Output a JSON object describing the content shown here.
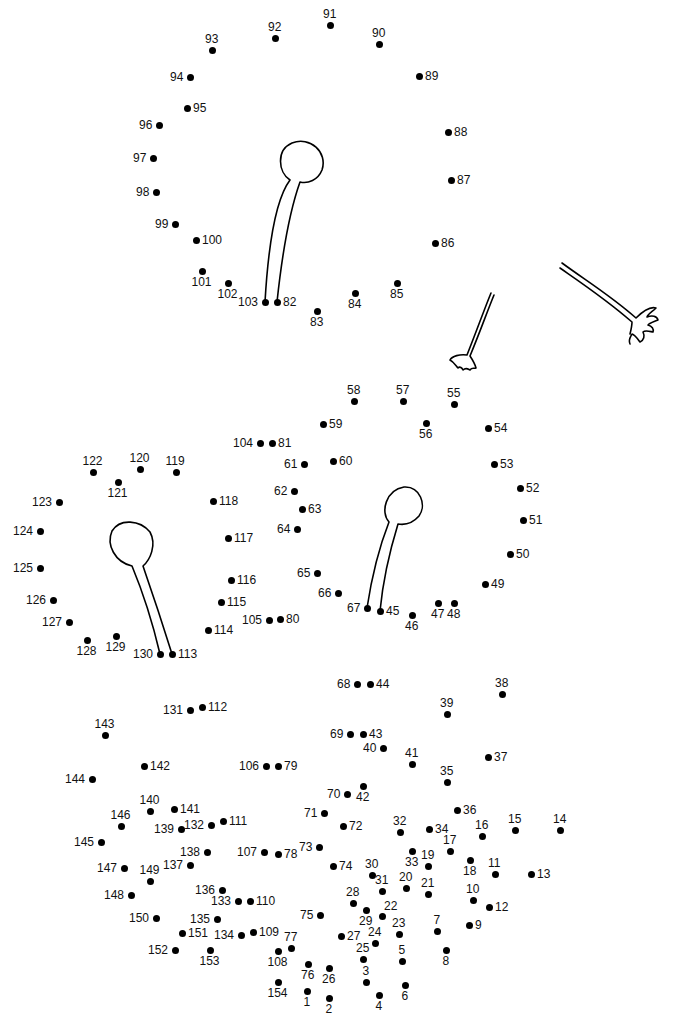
{
  "puzzle": {
    "title": "Connect the dots 1-154",
    "dot_color": "#000000",
    "line_color": "#000000",
    "dots": [
      {
        "n": 1,
        "x": 307,
        "y": 991,
        "lp": "b"
      },
      {
        "n": 2,
        "x": 329,
        "y": 998,
        "lp": "b"
      },
      {
        "n": 3,
        "x": 366,
        "y": 982,
        "lp": "t"
      },
      {
        "n": 4,
        "x": 379,
        "y": 995,
        "lp": "b"
      },
      {
        "n": 5,
        "x": 402,
        "y": 961,
        "lp": "t"
      },
      {
        "n": 6,
        "x": 405,
        "y": 985,
        "lp": "b"
      },
      {
        "n": 7,
        "x": 437,
        "y": 931,
        "lp": "t"
      },
      {
        "n": 8,
        "x": 446,
        "y": 950,
        "lp": "b"
      },
      {
        "n": 9,
        "x": 469,
        "y": 925,
        "lp": "r"
      },
      {
        "n": 10,
        "x": 473,
        "y": 900,
        "lp": "t"
      },
      {
        "n": 11,
        "x": 495,
        "y": 874,
        "lp": "t"
      },
      {
        "n": 12,
        "x": 489,
        "y": 907,
        "lp": "r"
      },
      {
        "n": 13,
        "x": 531,
        "y": 874,
        "lp": "r"
      },
      {
        "n": 14,
        "x": 560,
        "y": 830,
        "lp": "t"
      },
      {
        "n": 15,
        "x": 515,
        "y": 830,
        "lp": "t"
      },
      {
        "n": 16,
        "x": 482,
        "y": 836,
        "lp": "t"
      },
      {
        "n": 17,
        "x": 450,
        "y": 851,
        "lp": "t"
      },
      {
        "n": 18,
        "x": 470,
        "y": 860,
        "lp": "b"
      },
      {
        "n": 19,
        "x": 428,
        "y": 866,
        "lp": "t"
      },
      {
        "n": 20,
        "x": 406,
        "y": 888,
        "lp": "t"
      },
      {
        "n": 21,
        "x": 428,
        "y": 894,
        "lp": "t"
      },
      {
        "n": 22,
        "x": 382,
        "y": 916,
        "lp": "tr"
      },
      {
        "n": 23,
        "x": 399,
        "y": 934,
        "lp": "t"
      },
      {
        "n": 24,
        "x": 375,
        "y": 943,
        "lp": "t"
      },
      {
        "n": 25,
        "x": 363,
        "y": 959,
        "lp": "t"
      },
      {
        "n": 26,
        "x": 329,
        "y": 968,
        "lp": "b"
      },
      {
        "n": 27,
        "x": 341,
        "y": 936,
        "lp": "r"
      },
      {
        "n": 28,
        "x": 353,
        "y": 903,
        "lp": "t"
      },
      {
        "n": 29,
        "x": 366,
        "y": 910,
        "lp": "b"
      },
      {
        "n": 30,
        "x": 372,
        "y": 875,
        "lp": "t"
      },
      {
        "n": 31,
        "x": 382,
        "y": 891,
        "lp": "t"
      },
      {
        "n": 32,
        "x": 400,
        "y": 832,
        "lp": "t"
      },
      {
        "n": 33,
        "x": 412,
        "y": 851,
        "lp": "b"
      },
      {
        "n": 34,
        "x": 429,
        "y": 829,
        "lp": "r"
      },
      {
        "n": 35,
        "x": 447,
        "y": 782,
        "lp": "t"
      },
      {
        "n": 36,
        "x": 457,
        "y": 810,
        "lp": "r"
      },
      {
        "n": 37,
        "x": 488,
        "y": 757,
        "lp": "r"
      },
      {
        "n": 38,
        "x": 502,
        "y": 694,
        "lp": "t"
      },
      {
        "n": 39,
        "x": 447,
        "y": 714,
        "lp": "t"
      },
      {
        "n": 40,
        "x": 383,
        "y": 748,
        "lp": "l"
      },
      {
        "n": 41,
        "x": 412,
        "y": 764,
        "lp": "t"
      },
      {
        "n": 42,
        "x": 363,
        "y": 786,
        "lp": "b"
      },
      {
        "n": 43,
        "x": 363,
        "y": 734,
        "lp": "r"
      },
      {
        "n": 44,
        "x": 370,
        "y": 684,
        "lp": "r"
      },
      {
        "n": 45,
        "x": 380,
        "y": 611,
        "lp": "r"
      },
      {
        "n": 46,
        "x": 412,
        "y": 615,
        "lp": "b"
      },
      {
        "n": 47,
        "x": 438,
        "y": 603,
        "lp": "b"
      },
      {
        "n": 48,
        "x": 454,
        "y": 603,
        "lp": "b"
      },
      {
        "n": 49,
        "x": 485,
        "y": 584,
        "lp": "r"
      },
      {
        "n": 50,
        "x": 510,
        "y": 554,
        "lp": "r"
      },
      {
        "n": 51,
        "x": 523,
        "y": 520,
        "lp": "r"
      },
      {
        "n": 52,
        "x": 520,
        "y": 488,
        "lp": "r"
      },
      {
        "n": 53,
        "x": 494,
        "y": 464,
        "lp": "r"
      },
      {
        "n": 54,
        "x": 488,
        "y": 428,
        "lp": "r"
      },
      {
        "n": 55,
        "x": 454,
        "y": 404,
        "lp": "t"
      },
      {
        "n": 56,
        "x": 426,
        "y": 423,
        "lp": "b"
      },
      {
        "n": 57,
        "x": 403,
        "y": 401,
        "lp": "t"
      },
      {
        "n": 58,
        "x": 354,
        "y": 401,
        "lp": "t"
      },
      {
        "n": 59,
        "x": 323,
        "y": 424,
        "lp": "r"
      },
      {
        "n": 60,
        "x": 333,
        "y": 461,
        "lp": "r"
      },
      {
        "n": 61,
        "x": 304,
        "y": 464,
        "lp": "l"
      },
      {
        "n": 62,
        "x": 294,
        "y": 491,
        "lp": "l"
      },
      {
        "n": 63,
        "x": 302,
        "y": 509,
        "lp": "r"
      },
      {
        "n": 64,
        "x": 297,
        "y": 529,
        "lp": "l"
      },
      {
        "n": 65,
        "x": 317,
        "y": 573,
        "lp": "l"
      },
      {
        "n": 66,
        "x": 338,
        "y": 593,
        "lp": "l"
      },
      {
        "n": 67,
        "x": 367,
        "y": 608,
        "lp": "l"
      },
      {
        "n": 68,
        "x": 357,
        "y": 684,
        "lp": "l"
      },
      {
        "n": 69,
        "x": 350,
        "y": 734,
        "lp": "l"
      },
      {
        "n": 70,
        "x": 347,
        "y": 794,
        "lp": "l"
      },
      {
        "n": 71,
        "x": 324,
        "y": 813,
        "lp": "l"
      },
      {
        "n": 72,
        "x": 343,
        "y": 826,
        "lp": "r"
      },
      {
        "n": 73,
        "x": 319,
        "y": 847,
        "lp": "l"
      },
      {
        "n": 74,
        "x": 333,
        "y": 866,
        "lp": "r"
      },
      {
        "n": 75,
        "x": 320,
        "y": 915,
        "lp": "l"
      },
      {
        "n": 76,
        "x": 308,
        "y": 964,
        "lp": "b"
      },
      {
        "n": 77,
        "x": 291,
        "y": 948,
        "lp": "t"
      },
      {
        "n": 78,
        "x": 278,
        "y": 854,
        "lp": "r"
      },
      {
        "n": 79,
        "x": 278,
        "y": 766,
        "lp": "r"
      },
      {
        "n": 80,
        "x": 280,
        "y": 619,
        "lp": "r"
      },
      {
        "n": 81,
        "x": 272,
        "y": 443,
        "lp": "r"
      },
      {
        "n": 82,
        "x": 277,
        "y": 302,
        "lp": "r"
      },
      {
        "n": 83,
        "x": 317,
        "y": 311,
        "lp": "b"
      },
      {
        "n": 84,
        "x": 355,
        "y": 293,
        "lp": "b"
      },
      {
        "n": 85,
        "x": 397,
        "y": 283,
        "lp": "b"
      },
      {
        "n": 86,
        "x": 435,
        "y": 243,
        "lp": "r"
      },
      {
        "n": 87,
        "x": 451,
        "y": 180,
        "lp": "r"
      },
      {
        "n": 88,
        "x": 448,
        "y": 132,
        "lp": "r"
      },
      {
        "n": 89,
        "x": 419,
        "y": 76,
        "lp": "r"
      },
      {
        "n": 90,
        "x": 379,
        "y": 44,
        "lp": "t"
      },
      {
        "n": 91,
        "x": 330,
        "y": 25,
        "lp": "t"
      },
      {
        "n": 92,
        "x": 275,
        "y": 38,
        "lp": "t"
      },
      {
        "n": 93,
        "x": 212,
        "y": 50,
        "lp": "t"
      },
      {
        "n": 94,
        "x": 190,
        "y": 77,
        "lp": "l"
      },
      {
        "n": 95,
        "x": 187,
        "y": 108,
        "lp": "r"
      },
      {
        "n": 96,
        "x": 159,
        "y": 125,
        "lp": "l"
      },
      {
        "n": 97,
        "x": 153,
        "y": 158,
        "lp": "l"
      },
      {
        "n": 98,
        "x": 156,
        "y": 192,
        "lp": "l"
      },
      {
        "n": 99,
        "x": 175,
        "y": 224,
        "lp": "l"
      },
      {
        "n": 100,
        "x": 196,
        "y": 240,
        "lp": "r"
      },
      {
        "n": 101,
        "x": 202,
        "y": 271,
        "lp": "b"
      },
      {
        "n": 102,
        "x": 228,
        "y": 283,
        "lp": "b"
      },
      {
        "n": 103,
        "x": 265,
        "y": 302,
        "lp": "l"
      },
      {
        "n": 104,
        "x": 260,
        "y": 443,
        "lp": "l"
      },
      {
        "n": 105,
        "x": 269,
        "y": 620,
        "lp": "l"
      },
      {
        "n": 106,
        "x": 266,
        "y": 766,
        "lp": "l"
      },
      {
        "n": 107,
        "x": 264,
        "y": 852,
        "lp": "l"
      },
      {
        "n": 108,
        "x": 278,
        "y": 951,
        "lp": "b"
      },
      {
        "n": 109,
        "x": 253,
        "y": 932,
        "lp": "r"
      },
      {
        "n": 110,
        "x": 250,
        "y": 901,
        "lp": "r"
      },
      {
        "n": 111,
        "x": 223,
        "y": 821,
        "lp": "r"
      },
      {
        "n": 112,
        "x": 202,
        "y": 707,
        "lp": "r"
      },
      {
        "n": 113,
        "x": 172,
        "y": 654,
        "lp": "r"
      },
      {
        "n": 114,
        "x": 208,
        "y": 630,
        "lp": "r"
      },
      {
        "n": 115,
        "x": 221,
        "y": 602,
        "lp": "r"
      },
      {
        "n": 116,
        "x": 231,
        "y": 580,
        "lp": "r"
      },
      {
        "n": 117,
        "x": 228,
        "y": 538,
        "lp": "r"
      },
      {
        "n": 118,
        "x": 213,
        "y": 501,
        "lp": "r"
      },
      {
        "n": 119,
        "x": 176,
        "y": 472,
        "lp": "t"
      },
      {
        "n": 120,
        "x": 140,
        "y": 469,
        "lp": "t"
      },
      {
        "n": 121,
        "x": 118,
        "y": 482,
        "lp": "b"
      },
      {
        "n": 122,
        "x": 93,
        "y": 472,
        "lp": "t"
      },
      {
        "n": 123,
        "x": 59,
        "y": 502,
        "lp": "l"
      },
      {
        "n": 124,
        "x": 40,
        "y": 531,
        "lp": "l"
      },
      {
        "n": 125,
        "x": 40,
        "y": 568,
        "lp": "l"
      },
      {
        "n": 126,
        "x": 53,
        "y": 600,
        "lp": "l"
      },
      {
        "n": 127,
        "x": 69,
        "y": 622,
        "lp": "l"
      },
      {
        "n": 128,
        "x": 87,
        "y": 640,
        "lp": "b"
      },
      {
        "n": 129,
        "x": 116,
        "y": 636,
        "lp": "b"
      },
      {
        "n": 130,
        "x": 160,
        "y": 654,
        "lp": "l"
      },
      {
        "n": 131,
        "x": 190,
        "y": 710,
        "lp": "l"
      },
      {
        "n": 132,
        "x": 211,
        "y": 825,
        "lp": "l"
      },
      {
        "n": 133,
        "x": 238,
        "y": 901,
        "lp": "l"
      },
      {
        "n": 134,
        "x": 241,
        "y": 935,
        "lp": "l"
      },
      {
        "n": 135,
        "x": 217,
        "y": 919,
        "lp": "l"
      },
      {
        "n": 136,
        "x": 222,
        "y": 890,
        "lp": "l"
      },
      {
        "n": 137,
        "x": 190,
        "y": 865,
        "lp": "l"
      },
      {
        "n": 138,
        "x": 207,
        "y": 852,
        "lp": "l"
      },
      {
        "n": 139,
        "x": 181,
        "y": 829,
        "lp": "l"
      },
      {
        "n": 140,
        "x": 150,
        "y": 811,
        "lp": "t"
      },
      {
        "n": 141,
        "x": 174,
        "y": 809,
        "lp": "r"
      },
      {
        "n": 142,
        "x": 144,
        "y": 766,
        "lp": "r"
      },
      {
        "n": 143,
        "x": 105,
        "y": 735,
        "lp": "t"
      },
      {
        "n": 144,
        "x": 92,
        "y": 779,
        "lp": "l"
      },
      {
        "n": 145,
        "x": 101,
        "y": 842,
        "lp": "l"
      },
      {
        "n": 146,
        "x": 121,
        "y": 826,
        "lp": "t"
      },
      {
        "n": 147,
        "x": 124,
        "y": 868,
        "lp": "l"
      },
      {
        "n": 148,
        "x": 131,
        "y": 895,
        "lp": "l"
      },
      {
        "n": 149,
        "x": 150,
        "y": 881,
        "lp": "t"
      },
      {
        "n": 150,
        "x": 156,
        "y": 918,
        "lp": "l"
      },
      {
        "n": 151,
        "x": 182,
        "y": 933,
        "lp": "r"
      },
      {
        "n": 152,
        "x": 175,
        "y": 950,
        "lp": "l"
      },
      {
        "n": 153,
        "x": 210,
        "y": 950,
        "lp": "b"
      },
      {
        "n": 154,
        "x": 278,
        "y": 982,
        "lp": "b"
      }
    ]
  }
}
